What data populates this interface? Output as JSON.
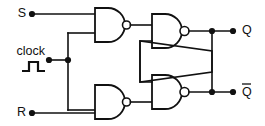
{
  "diagram": {
    "background_color": "#ffffff",
    "line_color": "#111111"
  },
  "labels": {
    "s_input": "S",
    "clock_input": "clock",
    "r_input": "R",
    "q_output": "Q",
    "qbar_output": "Q"
  },
  "symbols": {
    "clock_waveform": "pulse-waveform",
    "gate_type": "NAND"
  },
  "gates": [
    {
      "id": "nand-1",
      "name": "nand-gate-s",
      "label": "NAND",
      "x": 95,
      "y": 8,
      "w": 27,
      "h": 34
    },
    {
      "id": "nand-2",
      "name": "nand-gate-q",
      "label": "NAND",
      "x": 152,
      "y": 14,
      "w": 28,
      "h": 34
    },
    {
      "id": "nand-3",
      "name": "nand-gate-r",
      "label": "NAND",
      "x": 95,
      "y": 85,
      "w": 27,
      "h": 34
    },
    {
      "id": "nand-4",
      "name": "nand-gate-qbar",
      "label": "NAND",
      "x": 152,
      "y": 75,
      "w": 28,
      "h": 34
    }
  ],
  "terminals": [
    {
      "name": "s-terminal",
      "x": 32,
      "y": 14
    },
    {
      "name": "clock-terminal",
      "x": 49,
      "y": 60
    },
    {
      "name": "r-terminal",
      "x": 32,
      "y": 113
    },
    {
      "name": "q-terminal",
      "x": 233,
      "y": 31
    },
    {
      "name": "qbar-terminal",
      "x": 233,
      "y": 92
    }
  ],
  "junctions": [
    {
      "name": "clock-junction",
      "x": 68,
      "y": 60
    },
    {
      "name": "q-junction",
      "x": 212,
      "y": 31
    },
    {
      "name": "qbar-junction",
      "x": 212,
      "y": 92
    }
  ]
}
